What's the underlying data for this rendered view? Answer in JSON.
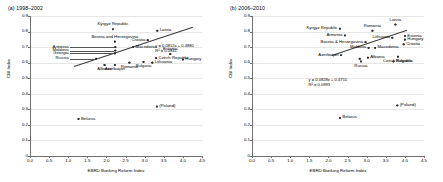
{
  "figure": {
    "x_axis_title": "EBRD Banking Reform Index",
    "y_axis_title": "CBI Index"
  },
  "chart_data": [
    {
      "type": "scatter",
      "panel": "a",
      "title": "(a) 1998–2002",
      "xlabel": "EBRD Banking Reform Index",
      "ylabel": "CBI Index",
      "xlim": [
        0.0,
        4.5
      ],
      "ylim": [
        0.0,
        0.9
      ],
      "xticks": [
        "0.0",
        "0.5",
        "1.0",
        "1.5",
        "2.0",
        "2.5",
        "3.0",
        "3.5",
        "4.0",
        "4.5"
      ],
      "yticks": [
        "0",
        "0.1",
        "0.2",
        "0.3",
        "0.4",
        "0.5",
        "0.6",
        "0.7",
        "0.8",
        "0.9"
      ],
      "grid": true,
      "legend": "none",
      "trendline": {
        "equation": "y = 0.0812x + 0.4880",
        "r2": "R² = 0.0841",
        "slope": 0.0812,
        "intercept": 0.488,
        "x_start": 1.15,
        "x_end": 4.25
      },
      "points": [
        {
          "label": "Kyrgyz Republic",
          "x": 2.17,
          "y": 0.815,
          "label_pos": "above"
        },
        {
          "label": "Latvia",
          "x": 3.33,
          "y": 0.805,
          "label_pos": "right"
        },
        {
          "label": "Bosnia and Herzegovina",
          "x": 2.22,
          "y": 0.735,
          "label_pos": "above"
        },
        {
          "label": "Croatia",
          "x": 3.08,
          "y": 0.745,
          "label_pos": "left"
        },
        {
          "label": "Armenia",
          "x": 2.23,
          "y": 0.7,
          "label_pos": "leader-left"
        },
        {
          "label": "Moldova",
          "x": 2.23,
          "y": 0.678,
          "label_pos": "leader-left"
        },
        {
          "label": "Georgia",
          "x": 2.22,
          "y": 0.66,
          "label_pos": "leader-left"
        },
        {
          "label": "Macedonia",
          "x": 2.7,
          "y": 0.7,
          "label_pos": "right"
        },
        {
          "label": "Estonia",
          "x": 3.67,
          "y": 0.655,
          "label_pos": "above"
        },
        {
          "label": "Czech Republic",
          "x": 3.3,
          "y": 0.63,
          "label_pos": "right"
        },
        {
          "label": "Hungary",
          "x": 4.0,
          "y": 0.62,
          "label_pos": "right"
        },
        {
          "label": "Russia",
          "x": 1.73,
          "y": 0.625,
          "label_pos": "leader-left"
        },
        {
          "label": "Romania",
          "x": 2.6,
          "y": 0.6,
          "label_pos": "below"
        },
        {
          "label": "Bulgaria",
          "x": 2.97,
          "y": 0.605,
          "label_pos": "below"
        },
        {
          "label": "Lithuania",
          "x": 3.2,
          "y": 0.6,
          "label_pos": "right"
        },
        {
          "label": "Albania",
          "x": 1.95,
          "y": 0.585,
          "label_pos": "below"
        },
        {
          "label": "Azerbaijan",
          "x": 2.22,
          "y": 0.585,
          "label_pos": "below"
        },
        {
          "label": "(Poland)",
          "x": 3.32,
          "y": 0.318,
          "label_pos": "right"
        },
        {
          "label": "Belarus",
          "x": 1.27,
          "y": 0.238,
          "label_pos": "right"
        }
      ]
    },
    {
      "type": "scatter",
      "panel": "b",
      "title": "(b) 2006–2010",
      "xlabel": "EBRD Banking Reform Index",
      "ylabel": "CBI Index",
      "xlim": [
        0.0,
        4.5
      ],
      "ylim": [
        0.0,
        0.9
      ],
      "xticks": [
        "0.0",
        "0.5",
        "1.0",
        "1.5",
        "2.0",
        "2.5",
        "3.0",
        "3.5",
        "4.0",
        "4.5"
      ],
      "yticks": [
        "0",
        "0.1",
        "0.2",
        "0.3",
        "0.4",
        "0.5",
        "0.6",
        "0.7",
        "0.8",
        "0.9"
      ],
      "grid": true,
      "legend": "none",
      "trendline": {
        "equation": "y = 0.0828x + 0.4755",
        "r2": "R² = 0.0993",
        "slope": 0.0828,
        "intercept": 0.4755,
        "x_start": 2.08,
        "x_end": 4.05
      },
      "points": [
        {
          "label": "Kyrgyz Republic",
          "x": 2.3,
          "y": 0.818,
          "label_pos": "left"
        },
        {
          "label": "Latvia",
          "x": 3.75,
          "y": 0.845,
          "label_pos": "above"
        },
        {
          "label": "Romania",
          "x": 3.15,
          "y": 0.805,
          "label_pos": "above"
        },
        {
          "label": "Armenia",
          "x": 2.43,
          "y": 0.775,
          "label_pos": "left"
        },
        {
          "label": "Estonia",
          "x": 4.0,
          "y": 0.772,
          "label_pos": "right"
        },
        {
          "label": "Lithuania",
          "x": 3.67,
          "y": 0.76,
          "label_pos": "left"
        },
        {
          "label": "Hungary",
          "x": 4.0,
          "y": 0.748,
          "label_pos": "right"
        },
        {
          "label": "Bosnia & Herzegovina",
          "x": 2.97,
          "y": 0.732,
          "label_pos": "left"
        },
        {
          "label": "Croatia",
          "x": 3.97,
          "y": 0.718,
          "label_pos": "right"
        },
        {
          "label": "Moldova",
          "x": 3.05,
          "y": 0.695,
          "label_pos": "left"
        },
        {
          "label": "Macedonia",
          "x": 3.22,
          "y": 0.695,
          "label_pos": "right"
        },
        {
          "label": "Azerbaijan",
          "x": 2.33,
          "y": 0.648,
          "label_pos": "left"
        },
        {
          "label": "Belarus2",
          "x": 2.82,
          "y": 0.625,
          "label_pos": "none"
        },
        {
          "label": "Albania",
          "x": 3.03,
          "y": 0.632,
          "label_pos": "right"
        },
        {
          "label": "Czech Republic",
          "x": 3.82,
          "y": 0.638,
          "label_pos": "below"
        },
        {
          "label": "Bulgaria",
          "x": 3.7,
          "y": 0.608,
          "label_pos": "right"
        },
        {
          "label": "Russia",
          "x": 2.85,
          "y": 0.608,
          "label_pos": "below"
        },
        {
          "label": "(Poland)",
          "x": 3.8,
          "y": 0.325,
          "label_pos": "right"
        },
        {
          "label": "Belarus",
          "x": 2.3,
          "y": 0.245,
          "label_pos": "right"
        }
      ]
    }
  ]
}
